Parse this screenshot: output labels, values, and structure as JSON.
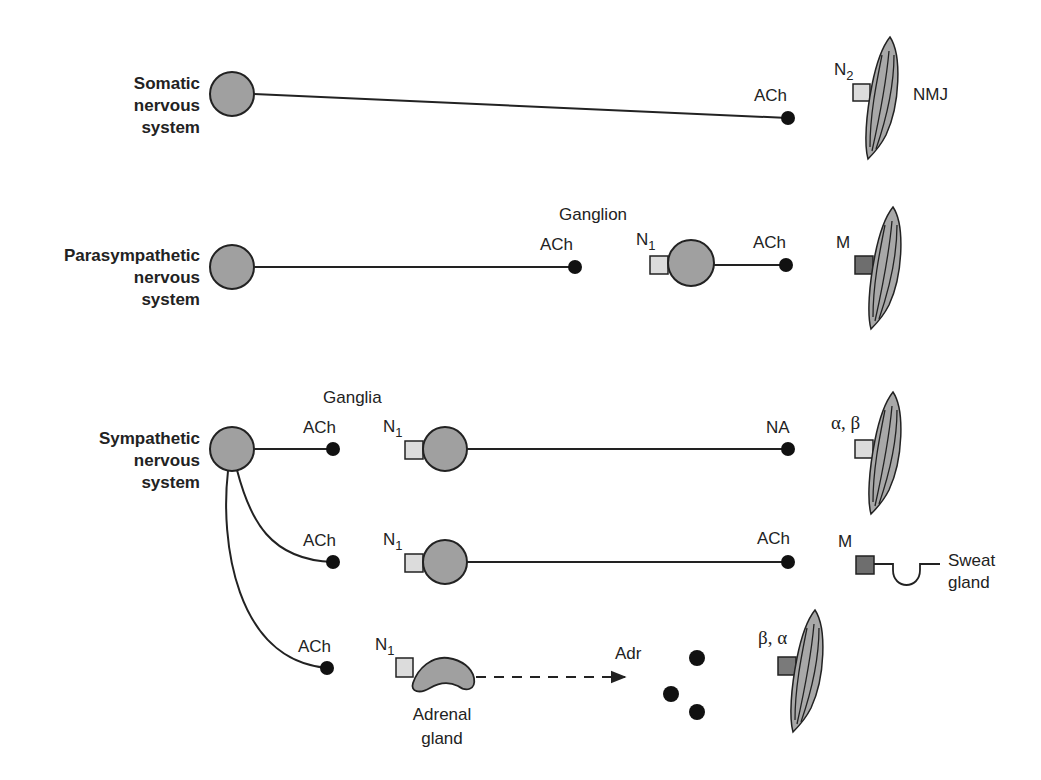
{
  "colors": {
    "neuron_fill": "#a0a0a0",
    "stroke": "#222222",
    "nicotinic_receptor_fill": "#dcdcdc",
    "muscarinic_receptor_fill": "#6e6e6e",
    "adrenergic_receptor_light": "#dcdcdc",
    "adrenergic_receptor_dark": "#7a7a7a",
    "muscle_fill": "#a8a8a8"
  },
  "systems": {
    "somatic": {
      "label": "Somatic\nnervous\nsystem",
      "terminal_transmitter": "ACh",
      "receptor": "N",
      "receptor_sub": "2",
      "target_label": "NMJ"
    },
    "parasympathetic": {
      "label": "Parasympathetic\nnervous\nsystem",
      "ganglion_label": "Ganglion",
      "pre_transmitter": "ACh",
      "ganglion_receptor": "N",
      "ganglion_receptor_sub": "1",
      "post_transmitter": "ACh",
      "target_receptor": "M"
    },
    "sympathetic": {
      "label": "Sympathetic\nnervous\nsystem",
      "ganglia_label": "Ganglia",
      "rows": [
        {
          "pre_transmitter": "ACh",
          "ganglion_receptor": "N",
          "ganglion_receptor_sub": "1",
          "post_transmitter": "NA",
          "target_receptor": "α, β"
        },
        {
          "pre_transmitter": "ACh",
          "ganglion_receptor": "N",
          "ganglion_receptor_sub": "1",
          "post_transmitter": "ACh",
          "target_receptor": "M",
          "target_label": "Sweat\ngland"
        },
        {
          "pre_transmitter": "ACh",
          "ganglion_receptor": "N",
          "ganglion_receptor_sub": "1",
          "organ_label": "Adrenal\ngland",
          "released_hormone": "Adr",
          "target_receptor": "β, α"
        }
      ]
    }
  }
}
